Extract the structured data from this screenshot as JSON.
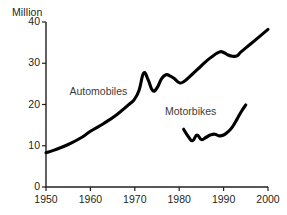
{
  "chart_data": {
    "type": "line",
    "title": "",
    "subtitle": "",
    "xlabel": "",
    "ylabel": "Million",
    "unit_label": "Million",
    "xlim": [
      1950,
      2000
    ],
    "ylim": [
      0,
      40
    ],
    "grid": false,
    "legend_position": "inline-annotations",
    "axis_color": "#231f20",
    "line_color": "#000000",
    "background_color": "#ffffff",
    "x_ticks": [
      1950,
      1960,
      1970,
      1980,
      1990,
      2000
    ],
    "x_tick_labels": [
      "1950",
      "1960",
      "1970",
      "1980",
      "1990",
      "2000"
    ],
    "y_ticks": [
      0,
      10,
      20,
      30,
      40
    ],
    "y_tick_labels": [
      "0",
      "10",
      "20",
      "30",
      "40"
    ],
    "series": [
      {
        "name": "Automobiles",
        "label": "Automobiles",
        "x": [
          1950,
          1952,
          1955,
          1958,
          1960,
          1963,
          1966,
          1969,
          1970,
          1971,
          1972,
          1973,
          1974,
          1975,
          1976,
          1977,
          1978,
          1979,
          1980,
          1981,
          1983,
          1985,
          1987,
          1989,
          1990,
          1991,
          1992,
          1993,
          1994,
          1996,
          1998,
          2000
        ],
        "values": [
          8.3,
          9.0,
          10.3,
          12.0,
          13.5,
          15.4,
          17.6,
          20.3,
          21.4,
          23.6,
          27.6,
          26.0,
          23.4,
          24.0,
          26.2,
          27.2,
          26.9,
          26.2,
          25.3,
          25.5,
          27.4,
          29.4,
          31.3,
          32.7,
          32.6,
          32.0,
          31.7,
          31.8,
          32.8,
          34.6,
          36.4,
          38.2
        ]
      },
      {
        "name": "Motorbikes",
        "label": "Motorbikes",
        "x": [
          1981,
          1982,
          1983,
          1984,
          1985,
          1986,
          1987,
          1988,
          1989,
          1990,
          1991,
          1992,
          1993,
          1994,
          1995
        ],
        "values": [
          14.0,
          12.3,
          11.2,
          12.6,
          11.5,
          12.0,
          12.6,
          12.8,
          12.4,
          12.6,
          13.4,
          14.6,
          16.4,
          18.3,
          19.9
        ]
      }
    ],
    "annotations": [
      {
        "text": "Automobiles",
        "x": 1962.5,
        "y": 23.0
      },
      {
        "text": "Motorbikes",
        "x": 1984.0,
        "y": 18.2
      }
    ]
  }
}
